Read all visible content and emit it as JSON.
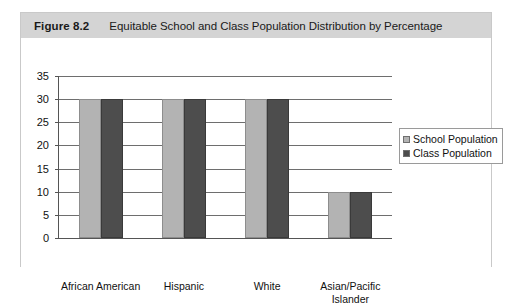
{
  "figure": {
    "number": "Figure 8.2",
    "caption": "Equitable School and Class Population Distribution by Percentage"
  },
  "colors": {
    "header_band": "#d4d4d4",
    "school_population": "#b3b3b3",
    "class_population": "#4d4d4d",
    "gridline": "#6e6e6e",
    "axis": "#555555"
  },
  "chart_data": {
    "type": "bar",
    "title": "Equitable School and Class Population Distribution by Percentage",
    "xlabel": "",
    "ylabel": "",
    "categories": [
      "African American",
      "Hispanic",
      "White",
      "Asian/Pacific\nIslander"
    ],
    "series": [
      {
        "name": "School Population",
        "values": [
          30,
          30,
          30,
          10
        ],
        "color": "#b3b3b3"
      },
      {
        "name": "Class Population",
        "values": [
          30,
          30,
          30,
          10
        ],
        "color": "#4d4d4d"
      }
    ],
    "ylim": [
      0,
      35
    ],
    "yticks": [
      0,
      5,
      10,
      15,
      20,
      25,
      30,
      35
    ],
    "ytick_labels": [
      "0",
      "5",
      "10",
      "15",
      "20",
      "25",
      "30",
      "35"
    ],
    "grid": true,
    "legend_position": "right"
  },
  "legend": {
    "entries": [
      {
        "label": "School Population"
      },
      {
        "label": "Class Population"
      }
    ]
  }
}
